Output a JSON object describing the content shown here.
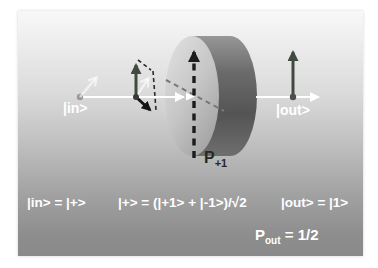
{
  "diagram": {
    "in_label": "|in>",
    "out_label": "|out>",
    "projector_label": {
      "base": "P",
      "subscript": "+1"
    }
  },
  "equations": {
    "input": "|in> = |+>",
    "superposition": "|+> = (|+1> + |-1>)/√2",
    "output": "|out> = |1>",
    "probability": {
      "base": "P",
      "subscript": "out",
      "rest": " = 1/2"
    }
  },
  "colors": {
    "slide_top": "#f8f8f8",
    "slide_bottom": "#8a8a8a",
    "beam_axis": "#ffffff",
    "spin_arrow": "#414a41",
    "component_arrow": "#141414",
    "ghost_arrow": "rgba(255,255,255,0.62)",
    "dashed_measure_arrow": "#1c1c1c",
    "projection_dashed_line": "#787878",
    "cylinder_face": "#cccccc",
    "cylinder_side": "#5e5e5e",
    "label_text": "#ffffff",
    "projector_text": "#282828"
  }
}
